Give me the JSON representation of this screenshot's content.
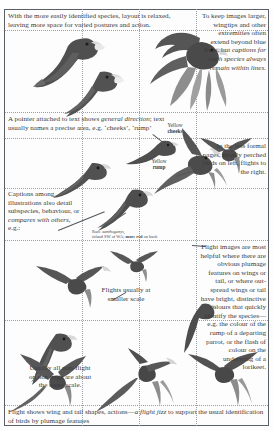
{
  "page": {
    "colors": {
      "ink": "#3b3b3b",
      "rule": "#9aa0a8",
      "frame": "#5b5f66",
      "bird": "#4a4a4a"
    }
  },
  "notes": {
    "top_left": "With the more easily identified species, layout is relaxed, leaving more space for varied postures and action.",
    "top_right_plain": "To keep images larger, wingtips and other extremities often extend beyond blue lines, but",
    "top_right_italic": "captions for each species always remain within lines.",
    "pointer_note_a": "A pointer attached to text shows ",
    "pointer_note_italic": "general direction",
    "pointer_note_b": "; text usually names a precise area, e.g. ‘cheeks’, ‘rump’",
    "mid_right": "In the less formal pages, mostly perched birds on left, flights to the right.",
    "captions_block_plain": "Captions among illustrations also detail subspecies, behaviour, or",
    "captions_block_italic": "compares with others",
    "captions_block_tail": ", e.g.:",
    "flights_scale": "Flights usually at smaller scale",
    "non_flight_scale": "Usually all non-flight on one page are about the same scale.",
    "lower_right": "Flight images are most helpful where there are obvious plumage features on wings or tail, or where out-spread wings or tail have bright, distinctive colours that quickly identify the species—e.g. the colour of the rump of a departing parrot, or the flash of colour on the underwing of a lorikeet.",
    "footer_plain_a": "Flight shows wing and tail shapes, actions—",
    "footer_italic": "a flight jizz",
    "footer_plain_b": " to support the usual identification of birds by plumage features"
  },
  "labels": {
    "cheeks_line1": "Yellow",
    "cheeks_line2": "cheeks",
    "rump_line1": "Yellow",
    "rump_line2": "rump",
    "race_line1_plain": "Race ",
    "race_line1_italic": "xanthogenys",
    "race_line1_tail": ",",
    "race_line2_plain_a": "inland SW of WA; ",
    "race_line2_bold": "more red",
    "race_line2_plain_b": " on back"
  },
  "figures": [
    {
      "name": "perched-parrot-upper-left",
      "kind": "perched"
    },
    {
      "name": "perched-parrot-lower-left",
      "kind": "perched"
    },
    {
      "name": "flight-parrot-upper-right",
      "kind": "flight"
    },
    {
      "name": "perched-parrot-cheeks",
      "kind": "perched"
    },
    {
      "name": "flight-parrot-rump",
      "kind": "flight"
    },
    {
      "name": "flight-parrot-mid-right",
      "kind": "flight"
    },
    {
      "name": "perched-parrot-mid-left",
      "kind": "perched"
    },
    {
      "name": "perched-parrot-race",
      "kind": "perched"
    },
    {
      "name": "flight-parrot-small-centre",
      "kind": "flight"
    },
    {
      "name": "flight-parrot-centre",
      "kind": "flight"
    },
    {
      "name": "perched-parrot-bottom-left",
      "kind": "perched"
    },
    {
      "name": "flight-parrot-bottom-left",
      "kind": "flight"
    },
    {
      "name": "flight-parrot-bottom-centre",
      "kind": "flight"
    },
    {
      "name": "flight-parrot-bottom-right",
      "kind": "flight"
    },
    {
      "name": "perched-parrot-lower-mid",
      "kind": "perched"
    }
  ]
}
